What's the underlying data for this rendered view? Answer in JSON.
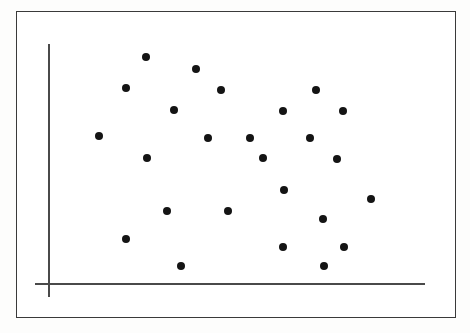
{
  "figure": {
    "background_color": "#fdfdfc",
    "frame": {
      "x": 16,
      "y": 11,
      "width": 440,
      "height": 307,
      "border_color": "#3a3a3a",
      "border_width": 1.4,
      "fill_color": "#ffffff"
    }
  },
  "chart_data": {
    "type": "scatter",
    "title": "",
    "subtitle": "",
    "xlabel": "",
    "ylabel": "",
    "xlim": [
      0,
      470
    ],
    "ylim": [
      0,
      333
    ],
    "grid": false,
    "legend": null,
    "annotations": [],
    "axis_style": {
      "color": "#4a4a4a",
      "line_width": 1.6,
      "tick_labels_x": [],
      "tick_labels_y": [],
      "ticks_visible": false
    },
    "axes": {
      "y_axis": {
        "x": 48,
        "y_top": 44,
        "y_bottom": 297
      },
      "x_axis": {
        "y": 283,
        "x_left": 35,
        "x_right": 425
      }
    },
    "marker": {
      "shape": "circle",
      "color": "#141414",
      "size_px": 8
    },
    "n_points": 26,
    "points": [
      {
        "x": 146,
        "y": 57
      },
      {
        "x": 196,
        "y": 69
      },
      {
        "x": 126,
        "y": 88
      },
      {
        "x": 221,
        "y": 90
      },
      {
        "x": 316,
        "y": 90
      },
      {
        "x": 174,
        "y": 110
      },
      {
        "x": 283,
        "y": 111
      },
      {
        "x": 343,
        "y": 111
      },
      {
        "x": 99,
        "y": 136
      },
      {
        "x": 208,
        "y": 138
      },
      {
        "x": 250,
        "y": 138
      },
      {
        "x": 310,
        "y": 138
      },
      {
        "x": 147,
        "y": 158
      },
      {
        "x": 263,
        "y": 158
      },
      {
        "x": 337,
        "y": 159
      },
      {
        "x": 284,
        "y": 190
      },
      {
        "x": 371,
        "y": 199
      },
      {
        "x": 167,
        "y": 211
      },
      {
        "x": 228,
        "y": 211
      },
      {
        "x": 323,
        "y": 219
      },
      {
        "x": 126,
        "y": 239
      },
      {
        "x": 283,
        "y": 247
      },
      {
        "x": 344,
        "y": 247
      },
      {
        "x": 181,
        "y": 266
      },
      {
        "x": 324,
        "y": 266
      }
    ]
  }
}
